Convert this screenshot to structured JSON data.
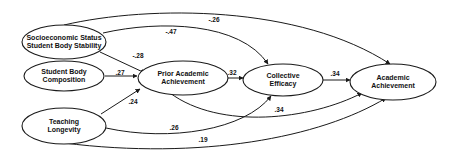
{
  "diagram": {
    "type": "path-model",
    "nodes": [
      {
        "id": "ses",
        "lines": [
          "Socioeconomic Status",
          "Student Body Stability"
        ]
      },
      {
        "id": "sbc",
        "lines": [
          "Student Body",
          "Composition"
        ]
      },
      {
        "id": "tl",
        "lines": [
          "Teaching",
          "Longevity"
        ]
      },
      {
        "id": "paa",
        "lines": [
          "Prior Academic",
          "Achievement"
        ]
      },
      {
        "id": "ce",
        "lines": [
          "Collective",
          "Efficacy"
        ]
      },
      {
        "id": "aa",
        "lines": [
          "Academic",
          "Achievement"
        ]
      }
    ],
    "edges": [
      {
        "from": "ses",
        "to": "aa",
        "coef": "-.26"
      },
      {
        "from": "ses",
        "to": "ce",
        "coef": "-.47"
      },
      {
        "from": "ses",
        "to": "paa",
        "coef": "-.28"
      },
      {
        "from": "sbc",
        "to": "paa",
        "coef": ".27"
      },
      {
        "from": "tl",
        "to": "paa",
        "coef": ".24"
      },
      {
        "from": "paa",
        "to": "ce",
        "coef": ".32"
      },
      {
        "from": "ce",
        "to": "aa",
        "coef": ".34"
      },
      {
        "from": "paa",
        "to": "aa",
        "coef": ".34"
      },
      {
        "from": "tl",
        "to": "ce",
        "coef": ".26"
      },
      {
        "from": "tl",
        "to": "aa",
        "coef": ".19"
      }
    ]
  }
}
